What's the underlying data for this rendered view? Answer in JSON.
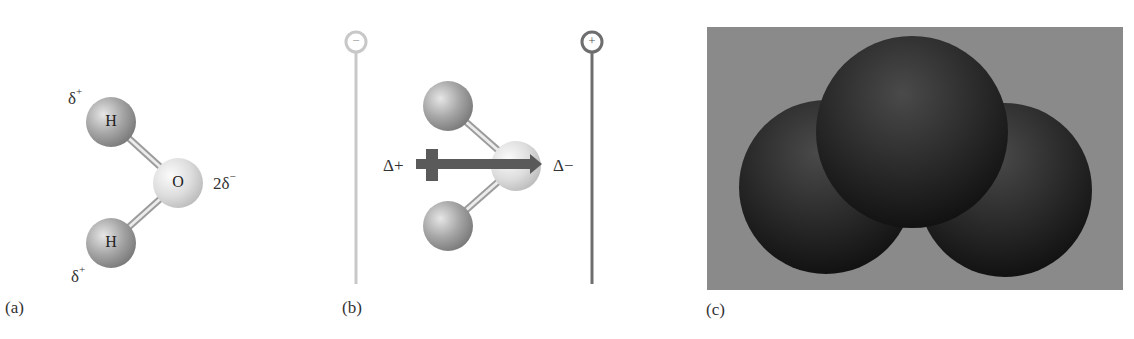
{
  "figure": {
    "panel_a": {
      "label": "(a)",
      "atoms": [
        {
          "symbol": "H",
          "charge": "δ",
          "charge_sup": "+"
        },
        {
          "symbol": "O",
          "charge": "2δ",
          "charge_sup": "−"
        },
        {
          "symbol": "H",
          "charge": "δ",
          "charge_sup": "+"
        }
      ]
    },
    "panel_b": {
      "label": "(b)",
      "negative_electrode": "−",
      "positive_electrode": "+",
      "dipole_start_label": "Δ+",
      "dipole_end_label": "Δ−"
    },
    "panel_c": {
      "label": "(c)",
      "description": "space-filling model"
    },
    "colors": {
      "background": "#ffffff",
      "atom_h": "#9a9a9a",
      "atom_o": "#d8d8d8",
      "electrode_negative": "#c8c8c8",
      "electrode_positive": "#6e6e6e",
      "dipole_arrow": "#5a5a5a",
      "panel_c_bg": "#8a8a8a",
      "panel_c_spheres": "#2a2a2a"
    }
  }
}
